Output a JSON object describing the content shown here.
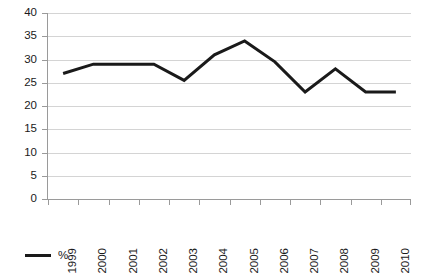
{
  "chart_data": {
    "type": "line",
    "title": "",
    "xlabel": "",
    "ylabel": "",
    "categories": [
      "1999",
      "2000",
      "2001",
      "2002",
      "2003",
      "2004",
      "2005",
      "2006",
      "2007",
      "2008",
      "2009",
      "2010"
    ],
    "series": [
      {
        "name": "%",
        "color": "#1a1a1a",
        "values": [
          27,
          29,
          29,
          29,
          25.5,
          31,
          34,
          29.5,
          23,
          28,
          23,
          23
        ]
      }
    ],
    "ylim": [
      0,
      40
    ],
    "ytick_step": 5,
    "yticks": [
      "40",
      "35",
      "30",
      "25",
      "20",
      "15",
      "10",
      "5",
      "0"
    ],
    "grid": true,
    "grid_axis": "y",
    "legend": {
      "position": "bottom-left",
      "entries": [
        {
          "label": "%",
          "color": "#1a1a1a"
        }
      ]
    }
  }
}
